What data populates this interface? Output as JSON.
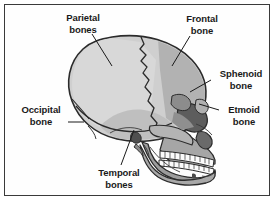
{
  "figure": {
    "style": "grayscale-line-drawing",
    "border_color": "#3a3a3a",
    "background_color": "#ffffff"
  },
  "labels": [
    {
      "id": "parietal",
      "name": "Parietal bones",
      "line1": "Parietal",
      "line2": "bones",
      "leader": {
        "x1": 92,
        "y1": 34,
        "x2": 112,
        "y2": 66
      }
    },
    {
      "id": "frontal",
      "name": "Frontal bone",
      "line1": "Frontal",
      "line2": "bone",
      "leader": {
        "x1": 190,
        "y1": 36,
        "x2": 172,
        "y2": 66
      }
    },
    {
      "id": "sphenoid",
      "name": "Sphenoid bone",
      "line1": "Sphenoid",
      "line2": "bone",
      "leader": {
        "x1": 211,
        "y1": 80,
        "x2": 190,
        "y2": 92
      }
    },
    {
      "id": "etmoid",
      "name": "Etmoid bone",
      "line1": "Etmoid",
      "line2": "bone",
      "leader": {
        "x1": 219,
        "y1": 110,
        "x2": 199,
        "y2": 104
      }
    },
    {
      "id": "occipital",
      "name": "Occipital bone",
      "line1": "Occipital",
      "line2": "bone",
      "leader": {
        "x1": 68,
        "y1": 122,
        "x2": 84,
        "y2": 122
      }
    },
    {
      "id": "temporal",
      "name": "Temporal bones",
      "line1": "Temporal",
      "line2": "bones",
      "leader": {
        "x1": 121,
        "y1": 165,
        "x2": 134,
        "y2": 130
      }
    }
  ],
  "palette": {
    "outline": "#2b2b2b",
    "cranium_light": "#d2d2d2",
    "cranium_mid": "#b8b8b8",
    "frontal_shade": "#a8a8a8",
    "temporal_shade": "#bdbdbd",
    "face_mid": "#9e9e9e",
    "orbit_dark": "#5a5a5a",
    "nasal_dark": "#6e6e6e",
    "mandible": "#9a9a9a",
    "teeth": "#fbfbfb"
  }
}
